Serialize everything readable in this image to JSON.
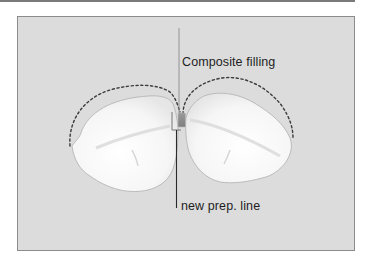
{
  "figure": {
    "labels": {
      "composite_filling": "Composite filling",
      "new_prep_line": "new prep. line"
    },
    "colors": {
      "background": "#dcdcdc",
      "frame_border": "#8c8c8c",
      "tooth_fill": "#ffffff",
      "tooth_outline": "#a8a8a8",
      "dashed_outline": "#3c3c3c",
      "composite_filling": "#8e8e8e",
      "leader_line_light": "#8a8a8a",
      "leader_line_dark": "#2a2a2a",
      "text": "#1e1e1e"
    },
    "elements": [
      "left-tooth",
      "right-tooth",
      "left-original-contour-dashed",
      "right-original-contour-dashed",
      "composite-filling",
      "new-prep-line-bracket"
    ]
  }
}
